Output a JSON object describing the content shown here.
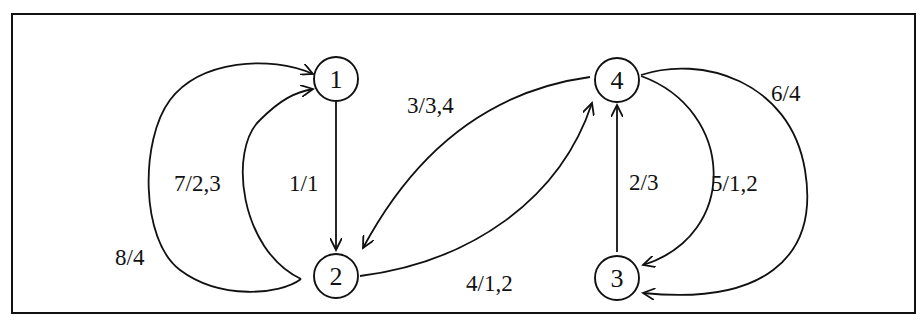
{
  "diagram": {
    "type": "state-transition-graph",
    "nodes": [
      {
        "id": "1",
        "label": "1"
      },
      {
        "id": "2",
        "label": "2"
      },
      {
        "id": "3",
        "label": "3"
      },
      {
        "id": "4",
        "label": "4"
      }
    ],
    "edges": [
      {
        "from": "1",
        "to": "2",
        "label": "1/1"
      },
      {
        "from": "3",
        "to": "4",
        "label": "2/3"
      },
      {
        "from": "4",
        "to": "2",
        "label": "3/3,4"
      },
      {
        "from": "2",
        "to": "4",
        "label": "4/1,2"
      },
      {
        "from": "4",
        "to": "3",
        "label": "5/1,2"
      },
      {
        "from": "4",
        "to": "3",
        "label": "6/4"
      },
      {
        "from": "2",
        "to": "1",
        "label": "7/2,3"
      },
      {
        "from": "2",
        "to": "1",
        "label": "8/4"
      }
    ]
  }
}
